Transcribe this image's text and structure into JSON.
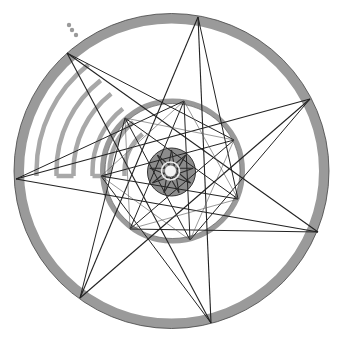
{
  "diagram": {
    "center": [
      171.5,
      171
    ],
    "colors": {
      "ring": "#9a9a9a",
      "ring_edge": "#444444",
      "disk": "#8c8c8c",
      "line": "#222222",
      "thin_line": "#555555",
      "background": "#ffffff"
    },
    "outer_ring": {
      "radius": 152.5,
      "width": 10
    },
    "middle_ring": {
      "radius": 70,
      "width": 5
    },
    "inner_disk": {
      "radius": 24
    },
    "core": {
      "radius": 6,
      "outline_radius": 9
    },
    "outer_star": {
      "type": "{7/3}",
      "vertices": [
        [
          198,
          17
        ],
        [
          310,
          99
        ],
        [
          318,
          232
        ],
        [
          211,
          323
        ],
        [
          80,
          298
        ],
        [
          16,
          179
        ],
        [
          67,
          53
        ]
      ]
    },
    "middle_star": {
      "type": "{7/3}",
      "vertices": [
        [
          184,
          101
        ],
        [
          234,
          140
        ],
        [
          238,
          199
        ],
        [
          190,
          240
        ],
        [
          130,
          229
        ],
        [
          101,
          176
        ],
        [
          125,
          118
        ]
      ]
    },
    "inner_star": {
      "type": "{9/4}",
      "points": 9,
      "radius": 22
    },
    "arcs": {
      "radii": [
        135,
        115,
        98,
        79,
        62,
        47
      ],
      "start_angle_deg": 180,
      "end_angle_deg": 232,
      "connected_pairs": [
        [
          1,
          2
        ],
        [
          3,
          4
        ]
      ]
    },
    "dots": [
      [
        69,
        25
      ],
      [
        72,
        30
      ],
      [
        76,
        35
      ]
    ]
  }
}
